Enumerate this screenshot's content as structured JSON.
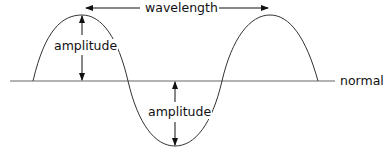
{
  "diagram": {
    "labels": {
      "wavelength": "wavelength",
      "amplitude_top": "amplitude",
      "amplitude_bottom": "amplitude",
      "normal": "normal"
    },
    "colors": {
      "line": "#333333",
      "axis": "#666666",
      "text": "#111111",
      "background": "#ffffff"
    }
  }
}
